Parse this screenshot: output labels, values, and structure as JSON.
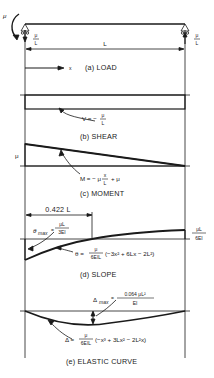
{
  "figure": {
    "panels": [
      {
        "id": "a",
        "caption": "(a) LOAD"
      },
      {
        "id": "b",
        "caption": "(b) SHEAR"
      },
      {
        "id": "c",
        "caption": "(c) MOMENT"
      },
      {
        "id": "d",
        "caption": "(d) SLOPE"
      },
      {
        "id": "e",
        "caption": "(e) ELASTIC CURVE"
      }
    ],
    "load": {
      "applied_moment": "μ",
      "left_reaction_num": "μ",
      "left_reaction_den": "L",
      "right_reaction_num": "μ",
      "right_reaction_den": "L",
      "span_label": "L",
      "x_axis_label": "x"
    },
    "shear": {
      "label_prefix": "V = −",
      "label_num": "μ",
      "label_den": "L"
    },
    "moment": {
      "left_value": "μ",
      "eq_prefix": "M = − μ",
      "eq_num": "x",
      "eq_den": "L",
      "eq_suffix": "+ μ"
    },
    "slope": {
      "dim_label": "0.422 L",
      "theta_max_prefix": "θ",
      "theta_max_sub": "max",
      "theta_max_eq": "=",
      "theta_max_num": "μL",
      "theta_max_den": "3EI",
      "right_num": "μL",
      "right_den": "6EI",
      "eq_prefix": "θ =",
      "eq_num": "μ",
      "eq_den": "6EIL",
      "eq_body": "(−3x² + 6Lx − 2L²)"
    },
    "elastic": {
      "delta_max_prefix": "Δ",
      "delta_max_sub": "max",
      "delta_max_eq": "=",
      "delta_max_num": "0.064 μL²",
      "delta_max_den": "EI",
      "eq_prefix": "Δ =",
      "eq_num": "μ",
      "eq_den": "6EIL",
      "eq_body": "(−x³ + 3Lx² − 2L²x)"
    }
  }
}
